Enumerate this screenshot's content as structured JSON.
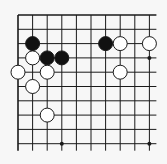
{
  "diagram": {
    "type": "go-board-fragment",
    "background": "#f7f7f7",
    "line_color": "#1a1a1a",
    "black_stone_color": "#111111",
    "white_stone_color": "#ffffff",
    "grid": {
      "origin_x": 18,
      "origin_y": 15,
      "spacing_x": 14.6,
      "spacing_y": 14.3,
      "cols": 10,
      "rows": 10,
      "extend_right": 7,
      "extend_bottom": 7,
      "top_edge": true,
      "left_edge": true
    },
    "star_points": [
      [
        3,
        9
      ],
      [
        9,
        3
      ],
      [
        9,
        9
      ]
    ],
    "stones": {
      "black": [
        [
          1,
          2
        ],
        [
          2,
          3
        ],
        [
          3,
          3
        ],
        [
          6,
          2
        ]
      ],
      "white": [
        [
          1,
          3
        ],
        [
          0,
          4
        ],
        [
          2,
          4
        ],
        [
          1,
          5
        ],
        [
          2,
          7
        ],
        [
          7,
          2
        ],
        [
          9,
          2
        ],
        [
          7,
          4
        ]
      ]
    },
    "stone_radius": 7
  }
}
